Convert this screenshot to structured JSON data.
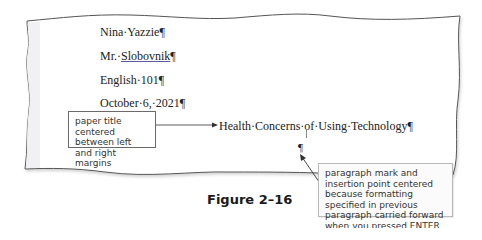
{
  "document": {
    "lines": [
      {
        "prefix": "Nina·Yazzie",
        "mark": "¶"
      },
      {
        "prefix": "Mr.·",
        "underlined": "Slobovnik",
        "mark": "¶"
      },
      {
        "prefix": "English·101",
        "mark": "¶"
      },
      {
        "prefix": "October·6,·2021",
        "mark": "¶"
      }
    ],
    "title": {
      "text": "Health·Concerns·of·Using·Technology",
      "mark": "¶"
    },
    "empty_paragraph_mark": "¶"
  },
  "callouts": {
    "title_callout": "paper title centered between left and right margins",
    "paragraph_callout": "paragraph mark and insertion point centered because formatting specified in previous paragraph carried forward when you pressed ENTER"
  },
  "figure": {
    "label": "Figure 2–16"
  },
  "colors": {
    "page_border": "#555555",
    "margin_strip": "#f1f1f3",
    "callout_border": "#6a6a6a",
    "arrow": "#333333"
  }
}
